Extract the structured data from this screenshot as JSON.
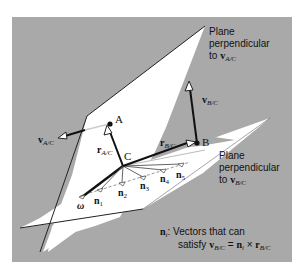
{
  "figure": {
    "background_color": "#a9a9a9",
    "plane_color": "#ffffff",
    "line_color": "#111111",
    "dashed_color": "#bdbdbd"
  },
  "labels": {
    "plane_a": {
      "line1": "Plane",
      "line2": "perpendicular",
      "line3_prefix": "to ",
      "vec": "v",
      "sub": "A/C"
    },
    "plane_b": {
      "line1": "Plane",
      "line2": "perpendicular",
      "line3_prefix": "to ",
      "vec": "v",
      "sub": "B/C"
    },
    "point_a": "A",
    "point_b": "B",
    "point_c": "C",
    "v_ac": {
      "vec": "v",
      "sub": "A/C"
    },
    "v_bc": {
      "vec": "v",
      "sub": "B/C"
    },
    "r_ac": {
      "vec": "r",
      "sub": "A/C"
    },
    "r_bc": {
      "vec": "r",
      "sub": "B/C"
    },
    "omega": "ω",
    "n_vectors": [
      {
        "base": "n",
        "sub": "1"
      },
      {
        "base": "n",
        "sub": "2"
      },
      {
        "base": "n",
        "sub": "3"
      },
      {
        "base": "n",
        "sub": "4"
      },
      {
        "base": "n",
        "sub": "5"
      }
    ],
    "legend": {
      "ni_base": "n",
      "ni_sub": "i",
      "line1_rest": ": Vectors that can",
      "line2_prefix": "satisfy ",
      "v": "v",
      "v_sub": "B/C",
      "eq": " = ",
      "n": "n",
      "n_sub": "i",
      "times": " × ",
      "r": "r",
      "r_sub": "B/C"
    }
  }
}
